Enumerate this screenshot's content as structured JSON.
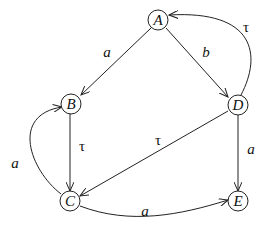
{
  "diagram": {
    "type": "labelled transition system",
    "nodes": [
      {
        "id": "A",
        "label": "A"
      },
      {
        "id": "B",
        "label": "B"
      },
      {
        "id": "C",
        "label": "C"
      },
      {
        "id": "D",
        "label": "D"
      },
      {
        "id": "E",
        "label": "E"
      }
    ],
    "edges": [
      {
        "from": "A",
        "to": "B",
        "label": "a"
      },
      {
        "from": "A",
        "to": "D",
        "label": "b"
      },
      {
        "from": "D",
        "to": "A",
        "label": "τ"
      },
      {
        "from": "B",
        "to": "C",
        "label": "τ"
      },
      {
        "from": "C",
        "to": "B",
        "label": "a"
      },
      {
        "from": "D",
        "to": "C",
        "label": "τ"
      },
      {
        "from": "D",
        "to": "E",
        "label": "a"
      },
      {
        "from": "C",
        "to": "E",
        "label": "a"
      }
    ]
  }
}
